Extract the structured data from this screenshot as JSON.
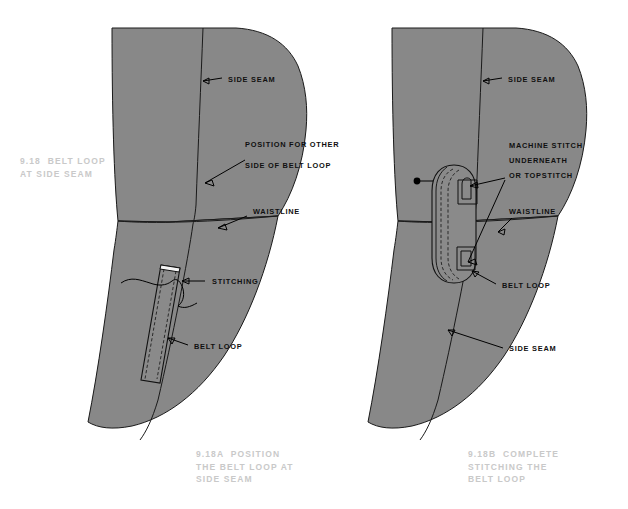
{
  "page": {
    "background_color": "#ffffff",
    "fabric_color": "#888888",
    "line_color": "#1a1a1a",
    "caption_color": "#c9c9c9",
    "callout_color": "#101010"
  },
  "captions": {
    "main": "9.18  BELT LOOP\nAT SIDE SEAM",
    "figure_a": "9.18A  POSITION\nTHE BELT LOOP AT\nSIDE SEAM",
    "figure_b": "9.18B  COMPLETE\nSTITCHING THE\nBELT LOOP"
  },
  "figures": [
    {
      "id": "figure-a",
      "label": "9.18A  POSITION THE BELT LOOP AT SIDE SEAM",
      "callouts": [
        {
          "id": "side-seam",
          "text": "SIDE SEAM"
        },
        {
          "id": "position-other-side-1",
          "text": "POSITION FOR OTHER"
        },
        {
          "id": "position-other-side-2",
          "text": "SIDE OF BELT LOOP"
        },
        {
          "id": "waistline",
          "text": "WAISTLINE"
        },
        {
          "id": "stitching",
          "text": "STITCHING"
        },
        {
          "id": "belt-loop",
          "text": "BELT LOOP"
        }
      ]
    },
    {
      "id": "figure-b",
      "label": "9.18B  COMPLETE STITCHING THE BELT LOOP",
      "callouts": [
        {
          "id": "side-seam-top",
          "text": "SIDE SEAM"
        },
        {
          "id": "machine-stitch-1",
          "text": "MACHINE STITCH"
        },
        {
          "id": "machine-stitch-2",
          "text": "UNDERNEATH"
        },
        {
          "id": "machine-stitch-3",
          "text": "OR TOPSTITCH"
        },
        {
          "id": "waistline",
          "text": "WAISTLINE"
        },
        {
          "id": "belt-loop",
          "text": "BELT LOOP"
        },
        {
          "id": "side-seam-bottom",
          "text": "SIDE SEAM"
        }
      ]
    }
  ]
}
